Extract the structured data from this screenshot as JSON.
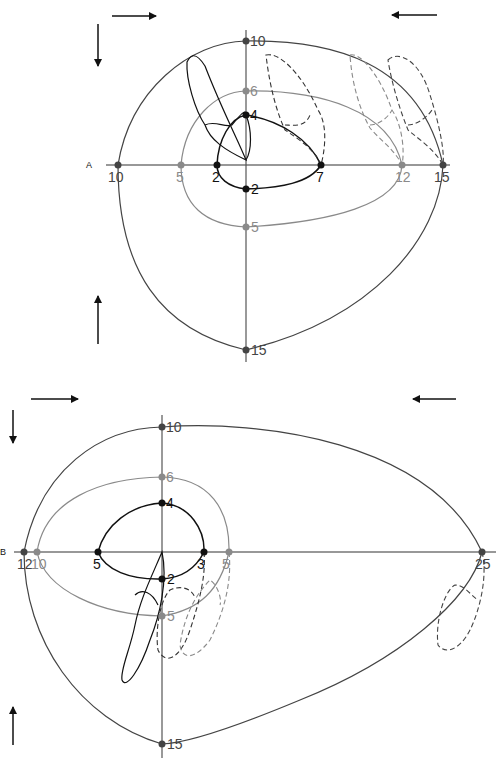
{
  "colors": {
    "black": "#111111",
    "dark_gray": "#444444",
    "mid_gray": "#7a7a7a",
    "light_gray": "#9a9a9a",
    "dash_black": "#333333",
    "dash_gray": "#8a8a8a"
  },
  "panels": [
    {
      "id": "A",
      "letter": "A",
      "outer_loop_labels": {
        "top": "10",
        "left": "10",
        "right": "15",
        "bottom": "15"
      },
      "middle_loop_labels": {
        "top": "6",
        "left": "5",
        "right": "12",
        "bottom": "5"
      },
      "inner_loop_labels": {
        "top": "4",
        "left": "2",
        "right": "7",
        "bottom": "2"
      }
    },
    {
      "id": "B",
      "letter": "B",
      "outer_loop_labels": {
        "top": "10",
        "left": "12",
        "right": "25",
        "bottom": "15"
      },
      "middle_loop_labels": {
        "top": "6",
        "left": "10",
        "right": "5",
        "bottom": "5"
      },
      "inner_loop_labels": {
        "top": "4",
        "left": "5",
        "right": "3",
        "bottom": "2"
      }
    }
  ],
  "arrows": {
    "top_left": "right-arrow",
    "top_right": "left-arrow",
    "left_upper": "down-arrow",
    "left_lower": "up-arrow"
  }
}
